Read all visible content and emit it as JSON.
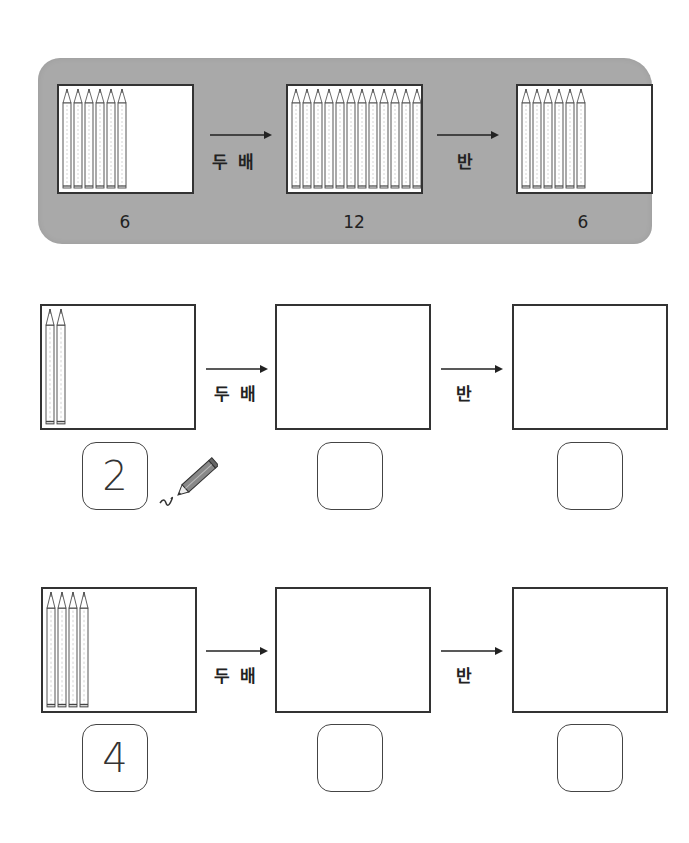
{
  "example": {
    "steps": [
      {
        "pencil_count": 6,
        "label": "6"
      },
      {
        "pencil_count": 12,
        "label": "12"
      },
      {
        "pencil_count": 6,
        "label": "6"
      }
    ],
    "operations": [
      "두 배",
      "반"
    ],
    "background_color": "#a9a9a9"
  },
  "problems": [
    {
      "start_pencils": 2,
      "operations": [
        "두 배",
        "반"
      ],
      "answers": [
        "2",
        "",
        ""
      ],
      "show_pencil_icon": true
    },
    {
      "start_pencils": 4,
      "operations": [
        "두 배",
        "반"
      ],
      "answers": [
        "4",
        "",
        ""
      ],
      "show_pencil_icon": false
    }
  ],
  "icons": {
    "pencil": "pencil-icon",
    "arrow": "arrow-right-icon",
    "writing_pencil": "writing-pencil-icon"
  }
}
